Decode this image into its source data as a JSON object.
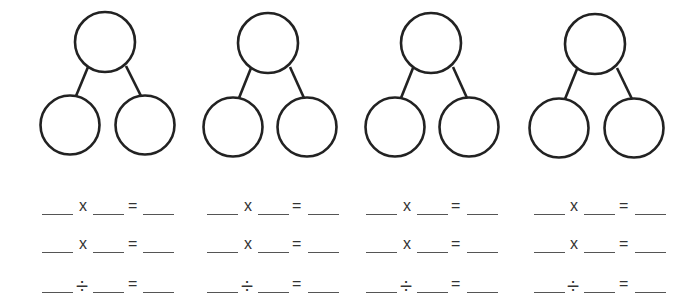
{
  "worksheet": {
    "bonds": [
      {
        "top": {
          "cx": 105,
          "cy": 42
        },
        "left": {
          "cx": 70,
          "cy": 125
        },
        "right": {
          "cx": 145,
          "cy": 125
        }
      },
      {
        "top": {
          "cx": 268,
          "cy": 43
        },
        "left": {
          "cx": 233,
          "cy": 127
        },
        "right": {
          "cx": 307,
          "cy": 127
        }
      },
      {
        "top": {
          "cx": 431,
          "cy": 43
        },
        "left": {
          "cx": 395,
          "cy": 127
        },
        "right": {
          "cx": 469,
          "cy": 127
        }
      },
      {
        "top": {
          "cx": 595,
          "cy": 44
        },
        "left": {
          "cx": 559,
          "cy": 128
        },
        "right": {
          "cx": 634,
          "cy": 128
        }
      }
    ],
    "symbols": {
      "multiply": "x",
      "divide": "÷",
      "equals": "="
    },
    "rows": [
      {
        "operator": "x"
      },
      {
        "operator": "x"
      },
      {
        "operator": "÷"
      }
    ]
  }
}
